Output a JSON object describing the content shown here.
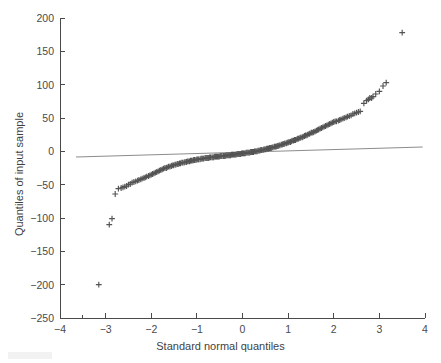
{
  "figure": {
    "background_color": "#ffffff",
    "axis_color": "#4a4a4a",
    "marker_color": "#545454",
    "line_color": "#8c8c8c"
  },
  "chart_data": {
    "type": "scatter",
    "title": "",
    "xlabel": "Standard normal quantiles",
    "ylabel": "Quantiles of input sample",
    "xlim": [
      -4,
      4
    ],
    "ylim": [
      -250,
      200
    ],
    "xticks": [
      -4,
      -3,
      -2,
      -1,
      0,
      1,
      2,
      3,
      4
    ],
    "xticklabels": [
      "-4",
      "-3",
      "-2",
      "-1",
      "0",
      "1",
      "2",
      "3",
      "4"
    ],
    "yticks": [
      -250,
      -200,
      -150,
      -100,
      -50,
      0,
      50,
      100,
      150,
      200
    ],
    "yticklabels": [
      "-250",
      "-200",
      "-150",
      "-100",
      "-50",
      "0",
      "50",
      "100",
      "150",
      "200"
    ],
    "grid": false,
    "legend": null,
    "marker": "+",
    "series": [
      {
        "name": "sample quantiles",
        "marker": "+",
        "points": [
          [
            -3.15,
            -200
          ],
          [
            -2.92,
            -110
          ],
          [
            -2.86,
            -101
          ],
          [
            -2.79,
            -64
          ],
          [
            -2.72,
            -56
          ],
          [
            -2.66,
            -55
          ],
          [
            -2.62,
            -54
          ],
          [
            -2.58,
            -53
          ],
          [
            -2.54,
            -52
          ],
          [
            -2.5,
            -50
          ],
          [
            -2.46,
            -49
          ],
          [
            -2.42,
            -47
          ],
          [
            -2.38,
            -46
          ],
          [
            -2.34,
            -45
          ],
          [
            -2.3,
            -44
          ],
          [
            -2.27,
            -43
          ],
          [
            -2.23,
            -42
          ],
          [
            -2.2,
            -41
          ],
          [
            -2.16,
            -40
          ],
          [
            -2.13,
            -39
          ],
          [
            -2.1,
            -38
          ],
          [
            -2.06,
            -37
          ],
          [
            -2.03,
            -36
          ],
          [
            -2.0,
            -35
          ],
          [
            -1.97,
            -34
          ],
          [
            -1.94,
            -33
          ],
          [
            -1.91,
            -32
          ],
          [
            -1.88,
            -31
          ],
          [
            -1.85,
            -30
          ],
          [
            -1.82,
            -29
          ],
          [
            -1.79,
            -28
          ],
          [
            -1.76,
            -27
          ],
          [
            -1.73,
            -26
          ],
          [
            -1.7,
            -25
          ],
          [
            -1.67,
            -25
          ],
          [
            -1.65,
            -24
          ],
          [
            -1.62,
            -23
          ],
          [
            -1.59,
            -23
          ],
          [
            -1.56,
            -22
          ],
          [
            -1.54,
            -21
          ],
          [
            -1.51,
            -21
          ],
          [
            -1.48,
            -20
          ],
          [
            -1.46,
            -20
          ],
          [
            -1.43,
            -19
          ],
          [
            -1.41,
            -19
          ],
          [
            -1.38,
            -18
          ],
          [
            -1.36,
            -18
          ],
          [
            -1.33,
            -17
          ],
          [
            -1.31,
            -17
          ],
          [
            -1.28,
            -17
          ],
          [
            -1.26,
            -16
          ],
          [
            -1.23,
            -16
          ],
          [
            -1.21,
            -15
          ],
          [
            -1.19,
            -15
          ],
          [
            -1.16,
            -15
          ],
          [
            -1.14,
            -14
          ],
          [
            -1.12,
            -14
          ],
          [
            -1.09,
            -14
          ],
          [
            -1.07,
            -13
          ],
          [
            -1.05,
            -13
          ],
          [
            -1.02,
            -13
          ],
          [
            -1.0,
            -12
          ],
          [
            -0.98,
            -12
          ],
          [
            -0.96,
            -12
          ],
          [
            -0.93,
            -12
          ],
          [
            -0.91,
            -11
          ],
          [
            -0.89,
            -11
          ],
          [
            -0.87,
            -11
          ],
          [
            -0.85,
            -11
          ],
          [
            -0.82,
            -10
          ],
          [
            -0.8,
            -10
          ],
          [
            -0.78,
            -10
          ],
          [
            -0.76,
            -10
          ],
          [
            -0.74,
            -10
          ],
          [
            -0.72,
            -9
          ],
          [
            -0.7,
            -9
          ],
          [
            -0.67,
            -9
          ],
          [
            -0.65,
            -9
          ],
          [
            -0.63,
            -9
          ],
          [
            -0.61,
            -8
          ],
          [
            -0.59,
            -8
          ],
          [
            -0.57,
            -8
          ],
          [
            -0.55,
            -8
          ],
          [
            -0.53,
            -8
          ],
          [
            -0.51,
            -8
          ],
          [
            -0.49,
            -7
          ],
          [
            -0.47,
            -7
          ],
          [
            -0.45,
            -7
          ],
          [
            -0.42,
            -7
          ],
          [
            -0.4,
            -7
          ],
          [
            -0.38,
            -7
          ],
          [
            -0.36,
            -6
          ],
          [
            -0.34,
            -6
          ],
          [
            -0.32,
            -6
          ],
          [
            -0.3,
            -6
          ],
          [
            -0.28,
            -6
          ],
          [
            -0.26,
            -6
          ],
          [
            -0.24,
            -5
          ],
          [
            -0.22,
            -5
          ],
          [
            -0.2,
            -5
          ],
          [
            -0.18,
            -5
          ],
          [
            -0.16,
            -5
          ],
          [
            -0.14,
            -5
          ],
          [
            -0.12,
            -4
          ],
          [
            -0.1,
            -4
          ],
          [
            -0.08,
            -4
          ],
          [
            -0.06,
            -4
          ],
          [
            -0.04,
            -4
          ],
          [
            -0.02,
            -3
          ],
          [
            0.0,
            -3
          ],
          [
            0.02,
            -3
          ],
          [
            0.04,
            -3
          ],
          [
            0.06,
            -3
          ],
          [
            0.08,
            -2
          ],
          [
            0.1,
            -2
          ],
          [
            0.12,
            -2
          ],
          [
            0.14,
            -2
          ],
          [
            0.16,
            -2
          ],
          [
            0.18,
            -1
          ],
          [
            0.2,
            -1
          ],
          [
            0.22,
            -1
          ],
          [
            0.24,
            -1
          ],
          [
            0.26,
            0
          ],
          [
            0.28,
            0
          ],
          [
            0.3,
            0
          ],
          [
            0.32,
            0
          ],
          [
            0.34,
            1
          ],
          [
            0.36,
            1
          ],
          [
            0.38,
            1
          ],
          [
            0.4,
            2
          ],
          [
            0.42,
            2
          ],
          [
            0.45,
            2
          ],
          [
            0.47,
            3
          ],
          [
            0.49,
            3
          ],
          [
            0.51,
            3
          ],
          [
            0.53,
            4
          ],
          [
            0.55,
            4
          ],
          [
            0.57,
            4
          ],
          [
            0.59,
            5
          ],
          [
            0.61,
            5
          ],
          [
            0.63,
            5
          ],
          [
            0.65,
            6
          ],
          [
            0.67,
            6
          ],
          [
            0.7,
            7
          ],
          [
            0.72,
            7
          ],
          [
            0.74,
            7
          ],
          [
            0.76,
            8
          ],
          [
            0.78,
            8
          ],
          [
            0.8,
            9
          ],
          [
            0.82,
            9
          ],
          [
            0.85,
            10
          ],
          [
            0.87,
            10
          ],
          [
            0.89,
            11
          ],
          [
            0.91,
            11
          ],
          [
            0.93,
            12
          ],
          [
            0.96,
            12
          ],
          [
            0.98,
            13
          ],
          [
            1.0,
            13
          ],
          [
            1.02,
            14
          ],
          [
            1.05,
            14
          ],
          [
            1.07,
            15
          ],
          [
            1.09,
            16
          ],
          [
            1.12,
            16
          ],
          [
            1.14,
            17
          ],
          [
            1.16,
            17
          ],
          [
            1.19,
            18
          ],
          [
            1.21,
            19
          ],
          [
            1.23,
            19
          ],
          [
            1.26,
            20
          ],
          [
            1.28,
            21
          ],
          [
            1.31,
            21
          ],
          [
            1.33,
            22
          ],
          [
            1.36,
            23
          ],
          [
            1.38,
            24
          ],
          [
            1.41,
            24
          ],
          [
            1.43,
            25
          ],
          [
            1.46,
            26
          ],
          [
            1.48,
            27
          ],
          [
            1.51,
            28
          ],
          [
            1.54,
            28
          ],
          [
            1.56,
            29
          ],
          [
            1.59,
            30
          ],
          [
            1.62,
            31
          ],
          [
            1.65,
            32
          ],
          [
            1.67,
            33
          ],
          [
            1.7,
            34
          ],
          [
            1.73,
            35
          ],
          [
            1.76,
            36
          ],
          [
            1.79,
            37
          ],
          [
            1.82,
            38
          ],
          [
            1.85,
            39
          ],
          [
            1.88,
            40
          ],
          [
            1.91,
            41
          ],
          [
            1.94,
            42
          ],
          [
            1.97,
            43
          ],
          [
            2.0,
            44
          ],
          [
            2.03,
            45
          ],
          [
            2.06,
            45
          ],
          [
            2.1,
            46
          ],
          [
            2.13,
            47
          ],
          [
            2.16,
            48
          ],
          [
            2.2,
            49
          ],
          [
            2.23,
            50
          ],
          [
            2.27,
            51
          ],
          [
            2.3,
            52
          ],
          [
            2.34,
            53
          ],
          [
            2.38,
            54
          ],
          [
            2.42,
            56
          ],
          [
            2.46,
            57
          ],
          [
            2.5,
            58
          ],
          [
            2.54,
            59
          ],
          [
            2.58,
            60
          ],
          [
            2.66,
            72
          ],
          [
            2.72,
            76
          ],
          [
            2.76,
            78
          ],
          [
            2.79,
            80
          ],
          [
            2.83,
            80
          ],
          [
            2.86,
            82
          ],
          [
            2.92,
            86
          ],
          [
            3.0,
            90
          ],
          [
            3.08,
            98
          ],
          [
            3.15,
            103
          ],
          [
            3.5,
            178
          ]
        ]
      }
    ],
    "reference_line": {
      "name": "robust reference line",
      "x": [
        -3.65,
        3.95
      ],
      "y": [
        -8.5,
        6.5
      ]
    }
  }
}
